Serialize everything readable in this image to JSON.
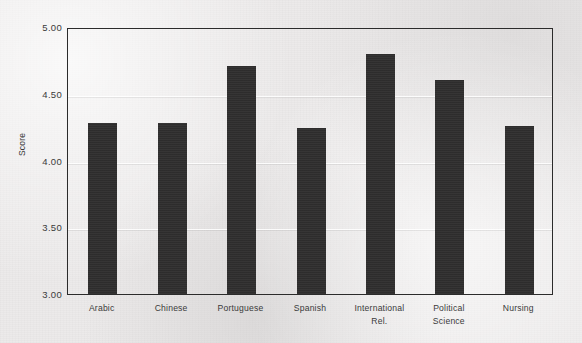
{
  "chart_data": {
    "type": "bar",
    "title": "",
    "xlabel": "",
    "ylabel": "Score",
    "ylim": [
      3.0,
      5.0
    ],
    "yticks": [
      "3.00",
      "3.50",
      "4.00",
      "4.50",
      "5.00"
    ],
    "ytick_values": [
      3.0,
      3.5,
      4.0,
      4.5,
      5.0
    ],
    "grid": true,
    "legend": "none",
    "bar_color": "#2f2e2e",
    "background_color": "#eceaea",
    "categories": [
      "Arabic",
      "Chinese",
      "Portuguese",
      "Spanish",
      "International Rel.",
      "Political Science",
      "Nursing"
    ],
    "category_lines": [
      [
        "Arabic"
      ],
      [
        "Chinese"
      ],
      [
        "Portuguese"
      ],
      [
        "Spanish"
      ],
      [
        "International",
        "Rel."
      ],
      [
        "Political",
        "Science"
      ],
      [
        "Nursing"
      ]
    ],
    "values": [
      4.28,
      4.28,
      4.71,
      4.24,
      4.8,
      4.6,
      4.26
    ]
  }
}
